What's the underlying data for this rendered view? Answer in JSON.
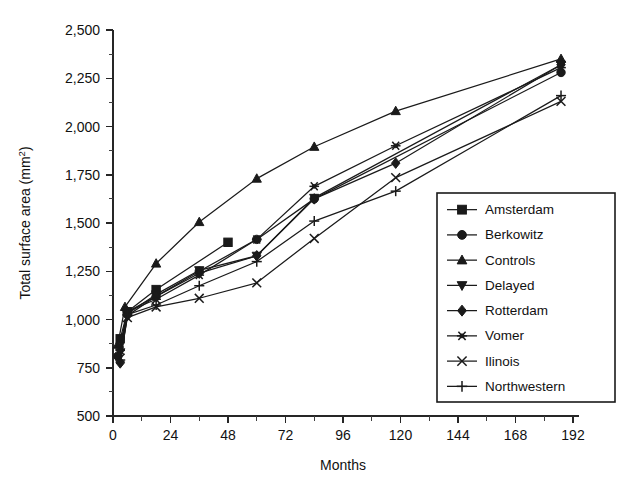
{
  "chart_data": {
    "type": "line",
    "title": "",
    "xlabel": "Months",
    "ylabel": "Total surface area (mm2)",
    "ylabel_base": "Total surface area (mm",
    "ylabel_sup": "2",
    "ylabel_close": ")",
    "xlim": [
      0,
      192
    ],
    "ylim": [
      500,
      2500
    ],
    "xticks": [
      0,
      24,
      48,
      72,
      96,
      120,
      144,
      168,
      192
    ],
    "xtick_labels": [
      "0",
      "24",
      "48",
      "72",
      "96",
      "120",
      "144",
      "168",
      "192"
    ],
    "yticks": [
      500,
      750,
      1000,
      1250,
      1500,
      1750,
      2000,
      2250,
      2500
    ],
    "ytick_labels": [
      "500",
      "750",
      "1,000",
      "1,250",
      "1,500",
      "1,750",
      "2,000",
      "2,250",
      "2,500"
    ],
    "x_minor_interval": 12,
    "y_minor_interval": 125,
    "grid": false,
    "legend_position": "right-inside",
    "line_color": "#1a1a1a",
    "background_color": "#ffffff",
    "series": [
      {
        "name": "Amsterdam",
        "marker": "square",
        "x": [
          3,
          6,
          18,
          48
        ],
        "y": [
          900,
          1040,
          1155,
          1400
        ]
      },
      {
        "name": "Berkowitz",
        "marker": "circle",
        "x": [
          2,
          6,
          18,
          36,
          60,
          84,
          187
        ],
        "y": [
          810,
          1040,
          1120,
          1250,
          1415,
          1625,
          2280
        ]
      },
      {
        "name": "Controls",
        "marker": "triangle-up",
        "x": [
          2,
          5,
          18,
          36,
          60,
          84,
          118,
          187
        ],
        "y": [
          870,
          1065,
          1290,
          1505,
          1730,
          1895,
          2080,
          2350
        ]
      },
      {
        "name": "Delayed",
        "marker": "triangle-down",
        "x": [
          3,
          6,
          18,
          36,
          60,
          84,
          187
        ],
        "y": [
          830,
          1030,
          1130,
          1255,
          1330,
          1630,
          2320
        ]
      },
      {
        "name": "Rotterdam",
        "marker": "diamond",
        "x": [
          3,
          6,
          18,
          36,
          60,
          84,
          118,
          187
        ],
        "y": [
          775,
          1020,
          1120,
          1240,
          1330,
          1625,
          1810,
          2320
        ]
      },
      {
        "name": "Vomer",
        "marker": "asterisk",
        "x": [
          3,
          6,
          18,
          36,
          60,
          84,
          118,
          187
        ],
        "y": [
          840,
          1040,
          1105,
          1230,
          1415,
          1690,
          1900,
          2305
        ]
      },
      {
        "name": "Ilinois",
        "marker": "cross-x",
        "x": [
          3,
          6,
          18,
          36,
          60,
          84,
          118,
          187
        ],
        "y": [
          800,
          1010,
          1065,
          1110,
          1190,
          1420,
          1735,
          2130
        ]
      },
      {
        "name": "Northwestern",
        "marker": "plus",
        "x": [
          3,
          6,
          18,
          36,
          60,
          84,
          118,
          187
        ],
        "y": [
          790,
          1025,
          1075,
          1175,
          1300,
          1510,
          1665,
          2160
        ]
      }
    ],
    "legend_entries": [
      {
        "label": "Amsterdam",
        "marker": "square"
      },
      {
        "label": "Berkowitz",
        "marker": "circle"
      },
      {
        "label": "Controls",
        "marker": "triangle-up"
      },
      {
        "label": "Delayed",
        "marker": "triangle-down"
      },
      {
        "label": "Rotterdam",
        "marker": "diamond"
      },
      {
        "label": "Vomer",
        "marker": "asterisk"
      },
      {
        "label": "Ilinois",
        "marker": "cross-x"
      },
      {
        "label": "Northwestern",
        "marker": "plus"
      }
    ]
  }
}
